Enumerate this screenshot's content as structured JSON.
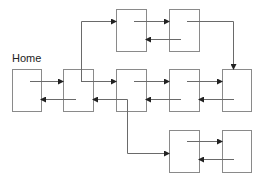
{
  "diagram": {
    "title_label": "Home",
    "nodes": [
      {
        "id": "home",
        "label": "Home",
        "x": 12,
        "y": 69,
        "w": 29,
        "h": 42
      },
      {
        "id": "n2",
        "x": 63,
        "y": 69,
        "w": 30,
        "h": 42
      },
      {
        "id": "n3",
        "x": 116,
        "y": 69,
        "w": 30,
        "h": 42
      },
      {
        "id": "n4",
        "x": 169,
        "y": 69,
        "w": 30,
        "h": 42
      },
      {
        "id": "n5",
        "x": 222,
        "y": 69,
        "w": 29,
        "h": 42
      },
      {
        "id": "t1",
        "x": 116,
        "y": 9,
        "w": 30,
        "h": 42
      },
      {
        "id": "t2",
        "x": 169,
        "y": 9,
        "w": 30,
        "h": 42
      },
      {
        "id": "b1",
        "x": 169,
        "y": 130,
        "w": 30,
        "h": 42
      },
      {
        "id": "b2",
        "x": 222,
        "y": 130,
        "w": 29,
        "h": 42
      }
    ],
    "edges": [
      {
        "from": "home",
        "to": "n2",
        "direction": "forward"
      },
      {
        "from": "n2",
        "to": "home",
        "direction": "back"
      },
      {
        "from": "n2",
        "to": "n3",
        "direction": "forward"
      },
      {
        "from": "n3",
        "to": "n2",
        "direction": "back"
      },
      {
        "from": "n3",
        "to": "n4",
        "direction": "forward"
      },
      {
        "from": "n4",
        "to": "n3",
        "direction": "back"
      },
      {
        "from": "n4",
        "to": "n5",
        "direction": "forward"
      },
      {
        "from": "n5",
        "to": "n4",
        "direction": "back"
      },
      {
        "from": "n2",
        "to": "t1",
        "direction": "branch-up"
      },
      {
        "from": "t1",
        "to": "t2",
        "direction": "forward"
      },
      {
        "from": "t2",
        "to": "t1",
        "direction": "back"
      },
      {
        "from": "t2",
        "to": "n5",
        "direction": "branch-down"
      },
      {
        "from": "n2",
        "to": "b1",
        "direction": "branch-down"
      },
      {
        "from": "b1",
        "to": "b2",
        "direction": "forward"
      },
      {
        "from": "b2",
        "to": "b1",
        "direction": "back"
      }
    ],
    "colors": {
      "box_stroke": "#8a8a8a",
      "line": "#6a6a6a",
      "arrow": "#222222",
      "text": "#222222",
      "background": "#ffffff"
    }
  }
}
